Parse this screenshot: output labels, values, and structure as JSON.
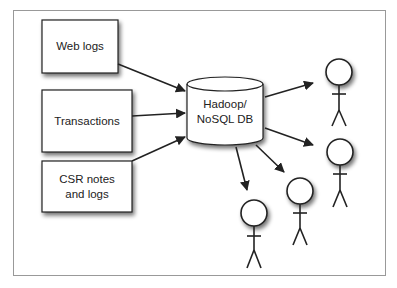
{
  "diagram": {
    "sources": [
      {
        "id": "web-logs",
        "label": "Web logs"
      },
      {
        "id": "transactions",
        "label": "Transactions"
      },
      {
        "id": "csr-notes",
        "label_line1": "CSR notes",
        "label_line2": "and logs"
      }
    ],
    "store": {
      "label_line1": "Hadoop/",
      "label_line2": "NoSQL DB",
      "icon": "database-cylinder-icon"
    },
    "consumers": [
      {
        "icon": "stick-figure-icon"
      },
      {
        "icon": "stick-figure-icon"
      },
      {
        "icon": "stick-figure-icon"
      },
      {
        "icon": "stick-figure-icon"
      }
    ],
    "colors": {
      "stroke": "#222222",
      "frame": "#999999",
      "fill": "#ffffff",
      "shadow": "#888888"
    }
  }
}
